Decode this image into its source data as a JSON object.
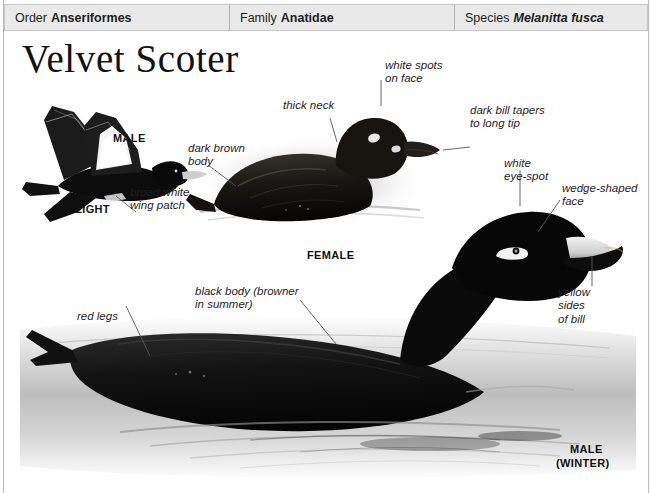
{
  "taxonomy": {
    "order": {
      "label": "Order",
      "value": "Anseriformes"
    },
    "family": {
      "label": "Family",
      "value": "Anatidae"
    },
    "species": {
      "label": "Species",
      "value": "Melanitta fusca"
    }
  },
  "title": "Velvet Scoter",
  "captions": {
    "in_flight": "IN FLIGHT",
    "male_flight": "MALE",
    "female": "FEMALE",
    "male_winter_line1": "MALE",
    "male_winter_line2": "(WINTER)"
  },
  "annotations": {
    "broad_white_wing_patch": "broad white\nwing patch",
    "dark_brown_body": "dark brown\nbody",
    "thick_neck": "thick neck",
    "white_spots_on_face": "white spots\non face",
    "dark_bill_tapers": "dark bill tapers\nto long tip",
    "white_eye_spot": "white\neye-spot",
    "wedge_shaped_face": "wedge-shaped\nface",
    "yellow_sides_of_bill": "yellow\nsides\nof bill",
    "red_legs": "red legs",
    "black_body": "black body (browner\nin summer)"
  },
  "colors": {
    "header_bg": "#e9e9e9",
    "header_border": "#c6c6c6",
    "text": "#1a1a1a",
    "leader": "#555555",
    "plumage_dark": "#141414",
    "water": "#c9c9c9"
  }
}
